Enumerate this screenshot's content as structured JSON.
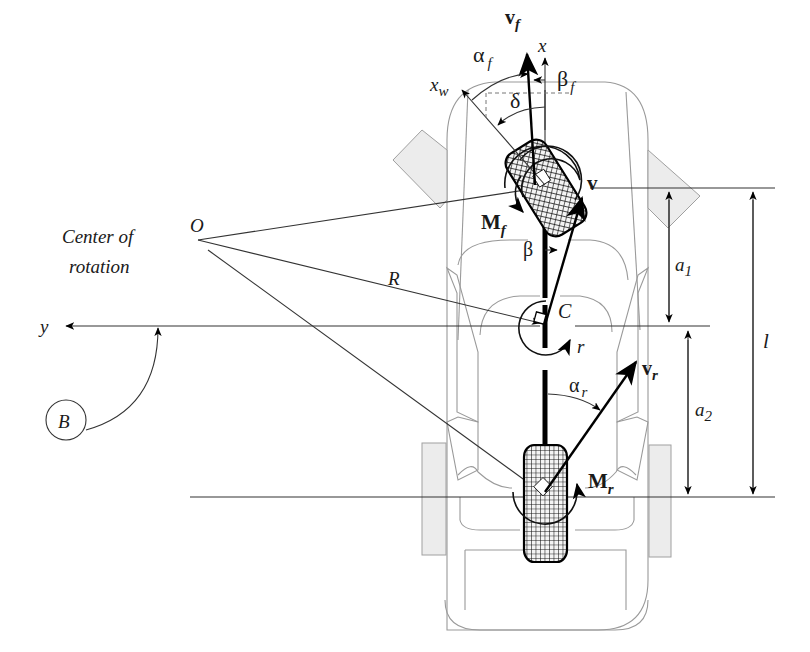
{
  "figure": {
    "type": "bicycle vehicle model top-view diagram",
    "colors": {
      "ink": "#000000",
      "body_outline": "#9a9a9a",
      "mirror_fill": "#ececec",
      "tire_hatch": "#1a1a1a"
    }
  },
  "labels": {
    "center_of_rotation_line1": "Center of",
    "center_of_rotation_line2": "rotation",
    "O": "O",
    "R": "R",
    "y": "y",
    "B": "B",
    "C": "C",
    "r": "r",
    "x": "x",
    "x_w": "x",
    "x_w_sub": "w",
    "v_f": "v",
    "v_f_sub": "f",
    "alpha_f": "α",
    "alpha_f_sub": "f",
    "beta_f": "β",
    "beta_f_sub": "f",
    "delta": "δ",
    "v": "v",
    "M_f": "M",
    "M_f_sub": "f",
    "beta": "β",
    "v_r": "v",
    "v_r_sub": "r",
    "alpha_r": "α",
    "alpha_r_sub": "r",
    "M_r": "M",
    "M_r_sub": "r",
    "a1": "a",
    "a1_sub": "1",
    "a2": "a",
    "a2_sub": "2",
    "l": "l"
  }
}
